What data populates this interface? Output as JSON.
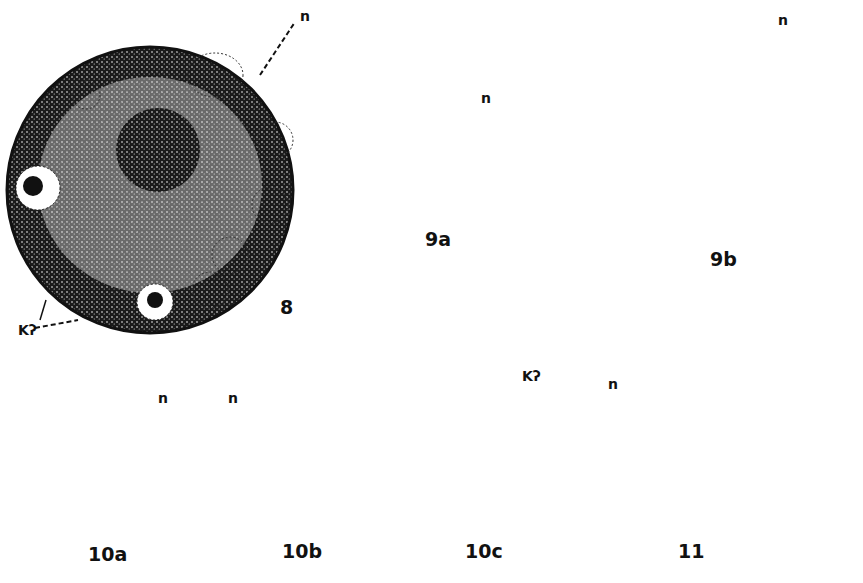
{
  "figure": {
    "background": "#ffffff",
    "ink": "#111111",
    "panels": [
      {
        "id": "8",
        "label": "8",
        "annotations": [
          "n",
          "Kʔ"
        ]
      },
      {
        "id": "9a",
        "label": "9a",
        "annotations": [
          "n"
        ]
      },
      {
        "id": "9b",
        "label": "9b",
        "annotations": [
          "n"
        ]
      },
      {
        "id": "10a",
        "label": "10a",
        "annotations": [
          "n"
        ]
      },
      {
        "id": "10b",
        "label": "10b",
        "annotations": [
          "n"
        ]
      },
      {
        "id": "10c",
        "label": "10c",
        "annotations": [
          "Kʔ"
        ]
      },
      {
        "id": "11",
        "label": "11",
        "annotations": [
          "n"
        ]
      }
    ]
  }
}
